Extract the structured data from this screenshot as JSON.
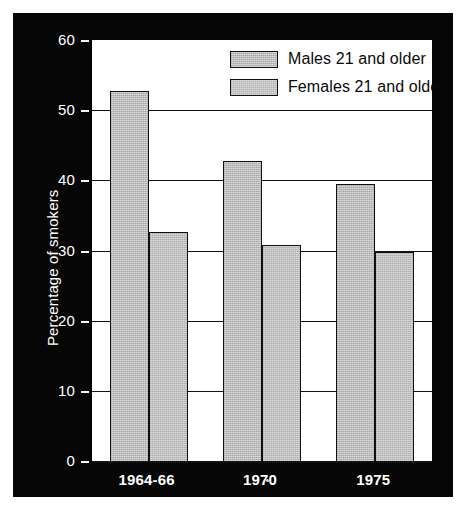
{
  "chart_data": {
    "type": "bar",
    "title": "",
    "xlabel": "",
    "ylabel": "Percentage of smokers",
    "categories": [
      "1964-66",
      "1970",
      "1975"
    ],
    "series": [
      {
        "name": "Males 21 and older",
        "values": [
          52.7,
          42.7,
          39.5
        ],
        "color": "#b4b4b4"
      },
      {
        "name": "Females 21 and older",
        "values": [
          32.7,
          30.8,
          29.8
        ],
        "color": "#b9b9b9"
      }
    ],
    "ylim": [
      0,
      60
    ],
    "ytick_values": [
      0,
      10,
      20,
      30,
      40,
      50,
      60
    ],
    "ytick_labels": [
      "0",
      "10",
      "20",
      "30",
      "40",
      "50",
      "60"
    ],
    "grid": true,
    "legend_position": "upper right (inside plot)"
  },
  "figure": {
    "background_color": "#ffffff",
    "panel_color": "#060606",
    "plot_background": "#ffffff",
    "axis_text_color": "#ffffff",
    "legend_text_color": "#0a0a0a"
  },
  "legend": {
    "entries": [
      {
        "label": "Males 21 and older"
      },
      {
        "label": "Females 21 and older"
      }
    ]
  }
}
